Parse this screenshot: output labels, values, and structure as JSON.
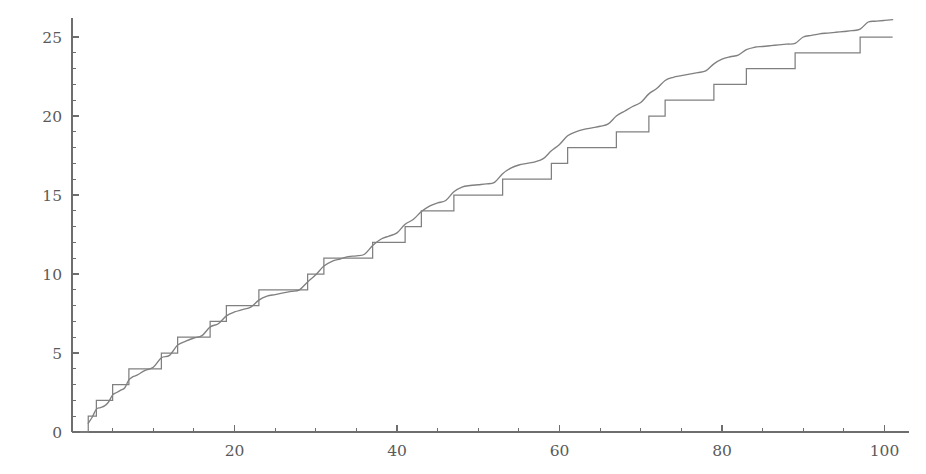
{
  "chart_data": {
    "type": "line",
    "title": "",
    "subtitle": "",
    "xlabel": "",
    "ylabel": "",
    "xlim": [
      0,
      103
    ],
    "ylim": [
      0,
      26.2
    ],
    "grid": false,
    "legend_position": "none",
    "x_ticks_major": [
      20,
      40,
      60,
      80,
      100
    ],
    "x_tick_labels": [
      "20",
      "40",
      "60",
      "80",
      "100"
    ],
    "x_ticks_minor": [
      5,
      10,
      15,
      25,
      30,
      35,
      45,
      50,
      55,
      65,
      70,
      75,
      85,
      90,
      95
    ],
    "y_ticks_major": [
      0,
      5,
      10,
      15,
      20,
      25
    ],
    "y_tick_labels": [
      "0",
      "5",
      "10",
      "15",
      "20",
      "25"
    ],
    "y_ticks_minor": [
      1,
      2,
      3,
      4,
      6,
      7,
      8,
      9,
      11,
      12,
      13,
      14,
      16,
      17,
      18,
      19,
      21,
      22,
      23,
      24
    ],
    "colors": {
      "step_series": "#808080",
      "smooth_series": "#808080",
      "axis": "#6e6e6e",
      "tick_label": "#5a5a5a",
      "background": "#ffffff"
    },
    "series": [
      {
        "name": "prime-counting-step",
        "style": "step",
        "jump_x": [
          2,
          3,
          5,
          7,
          11,
          13,
          17,
          19,
          23,
          29,
          31,
          37,
          41,
          43,
          47,
          53,
          59,
          61,
          67,
          71,
          73,
          79,
          83,
          89,
          97
        ],
        "values": [
          1,
          2,
          3,
          4,
          5,
          6,
          7,
          8,
          9,
          10,
          11,
          12,
          13,
          14,
          15,
          16,
          17,
          18,
          19,
          20,
          21,
          22,
          23,
          24,
          25
        ],
        "x_start": 1,
        "y_start": 0,
        "x_end": 101,
        "y_end": 25
      },
      {
        "name": "smooth-approximation",
        "style": "smooth",
        "x": [
          2,
          2.5,
          3,
          3.5,
          4,
          4.5,
          5,
          5.5,
          6,
          6.5,
          7,
          7.5,
          8,
          9,
          10,
          11,
          12,
          13,
          14,
          15,
          16,
          17,
          18,
          19,
          20,
          21,
          22,
          23,
          24,
          25,
          26,
          27,
          28,
          29,
          30,
          31,
          32,
          33,
          34,
          35,
          36,
          37,
          38,
          39,
          40,
          41,
          42,
          43,
          44,
          45,
          46,
          47,
          48,
          49,
          50,
          51,
          52,
          53,
          54,
          55,
          56,
          57,
          58,
          59,
          60,
          61,
          62,
          63,
          64,
          65,
          66,
          67,
          68,
          69,
          70,
          71,
          72,
          73,
          74,
          75,
          76,
          77,
          78,
          79,
          80,
          81,
          82,
          83,
          84,
          85,
          86,
          87,
          88,
          89,
          90,
          91,
          92,
          93,
          94,
          95,
          96,
          97,
          98,
          99,
          100,
          101
        ],
        "y": [
          0.55,
          0.95,
          1.45,
          1.55,
          1.65,
          1.9,
          2.35,
          2.5,
          2.65,
          2.8,
          3.3,
          3.5,
          3.6,
          3.9,
          4.1,
          4.7,
          4.85,
          5.5,
          5.75,
          5.95,
          6.1,
          6.65,
          6.85,
          7.35,
          7.6,
          7.75,
          7.9,
          8.35,
          8.6,
          8.7,
          8.8,
          8.9,
          9.0,
          9.5,
          9.95,
          10.5,
          10.8,
          10.95,
          11.1,
          11.15,
          11.25,
          11.8,
          12.2,
          12.4,
          12.6,
          13.15,
          13.45,
          13.95,
          14.3,
          14.5,
          14.65,
          15.2,
          15.5,
          15.6,
          15.65,
          15.7,
          15.8,
          16.35,
          16.7,
          16.9,
          17.0,
          17.1,
          17.3,
          17.8,
          18.2,
          18.75,
          19.0,
          19.15,
          19.25,
          19.35,
          19.5,
          20.0,
          20.3,
          20.6,
          20.85,
          21.4,
          21.75,
          22.25,
          22.45,
          22.55,
          22.65,
          22.75,
          22.85,
          23.3,
          23.6,
          23.75,
          23.85,
          24.2,
          24.35,
          24.4,
          24.45,
          24.5,
          24.55,
          24.6,
          25.0,
          25.1,
          25.2,
          25.25,
          25.3,
          25.35,
          25.4,
          25.5,
          25.95,
          26.0,
          26.05,
          26.1
        ]
      }
    ]
  }
}
